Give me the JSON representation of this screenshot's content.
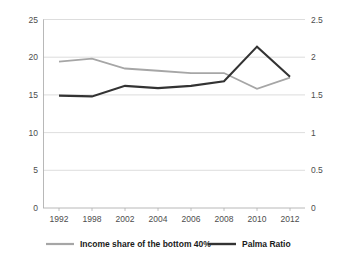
{
  "chart_data": {
    "type": "line",
    "title": "",
    "xlabel": "",
    "grid": true,
    "legend_position": "bottom",
    "x": [
      "1992",
      "1998",
      "2002",
      "2004",
      "2006",
      "2008",
      "2010",
      "2012"
    ],
    "categories": [
      "1992",
      "1998",
      "2002",
      "2004",
      "2006",
      "2008",
      "2010",
      "2012"
    ],
    "axes": {
      "left": {
        "label": "",
        "ylim": [
          0,
          25
        ],
        "ticks": [
          "0",
          "5",
          "10",
          "15",
          "20",
          "25"
        ],
        "tick_values": [
          0,
          5,
          10,
          15,
          20,
          25
        ],
        "series": "Income share of the  bottom 40%"
      },
      "right": {
        "label": "",
        "ylim": [
          0,
          2.5
        ],
        "ticks": [
          "0",
          "0.5",
          "1",
          "1.5",
          "2",
          "2.5"
        ],
        "tick_values": [
          0,
          0.5,
          1,
          1.5,
          2,
          2.5
        ],
        "series": "Palma Ratio"
      }
    },
    "series": [
      {
        "name": "Income share of the  bottom 40%",
        "axis": "left",
        "color": "#a6a6a6",
        "stroke_width": 1.8,
        "values": [
          19.4,
          19.8,
          18.5,
          18.2,
          17.9,
          17.9,
          15.8,
          17.3
        ]
      },
      {
        "name": "Palma Ratio",
        "axis": "right",
        "color": "#333333",
        "stroke_width": 2.1,
        "values": [
          1.49,
          1.48,
          1.62,
          1.59,
          1.62,
          1.68,
          2.14,
          1.74
        ]
      }
    ]
  },
  "legend": {
    "items": [
      {
        "label": "Income share of the  bottom 40%",
        "color": "#a6a6a6"
      },
      {
        "label": "Palma Ratio",
        "color": "#333333"
      }
    ]
  },
  "ticks": {
    "left": [
      "25",
      "20",
      "15",
      "10",
      "5",
      "0"
    ],
    "right": [
      "2.5",
      "2",
      "1.5",
      "1",
      "0.5",
      "0"
    ],
    "x": [
      "1992",
      "1998",
      "2002",
      "2004",
      "2006",
      "2008",
      "2010",
      "2012"
    ]
  }
}
